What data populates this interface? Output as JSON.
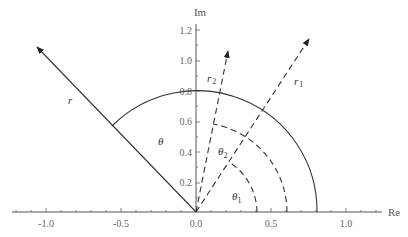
{
  "diagram": {
    "axes": {
      "x_label": "Re",
      "y_label": "Im",
      "x_ticks": [
        "-1.0",
        "-0.5",
        "0.0",
        "0.5",
        "1.0"
      ],
      "y_ticks": [
        "0.2",
        "0.4",
        "0.6",
        "0.8",
        "1.0",
        "1.2"
      ]
    },
    "vectors": [
      {
        "name": "r",
        "style": "solid",
        "angle_deg": 134,
        "length": 1.55
      },
      {
        "name": "r1",
        "style": "dashed",
        "angle_deg": 57,
        "length": 1.38
      },
      {
        "name": "r2",
        "style": "dashed",
        "angle_deg": 79,
        "length": 1.1
      }
    ],
    "arcs": [
      {
        "label": "θ",
        "style": "solid",
        "radius": 0.8,
        "from_deg": 0,
        "to_deg": 134
      },
      {
        "label": "θ2",
        "style": "dashed",
        "radius": 0.6,
        "from_deg": 0,
        "to_deg": 79
      },
      {
        "label": "θ1",
        "style": "dashed",
        "radius": 0.4,
        "from_deg": 0,
        "to_deg": 57
      }
    ],
    "labels": {
      "r": "r",
      "r1_base": "r",
      "r1_sub": "1",
      "r2_base": "r",
      "r2_sub": "2",
      "theta": "θ",
      "theta1_base": "θ",
      "theta1_sub": "1",
      "theta2_base": "θ",
      "theta2_sub": "2"
    }
  }
}
